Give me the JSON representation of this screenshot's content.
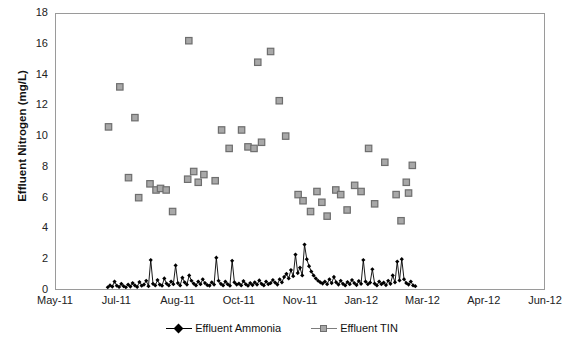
{
  "chart_data": {
    "type": "scatter",
    "title": "",
    "xlabel": "",
    "ylabel": "Effluent Nitrogen (mg/L)",
    "ylim": [
      0,
      18
    ],
    "yticks": [
      0,
      2,
      4,
      6,
      8,
      10,
      12,
      14,
      16,
      18
    ],
    "xticks": [
      "May-11",
      "Jul-11",
      "Aug-11",
      "Oct-11",
      "Nov-11",
      "Jan-12",
      "Mar-12",
      "Apr-12",
      "Jun-12"
    ],
    "xlim_months": [
      0,
      13
    ],
    "grid": true,
    "legend_position": "bottom",
    "series": [
      {
        "name": "Effluent TIN",
        "marker": "square",
        "color": "#a8a8a8",
        "edge_color": "#6e6e6e",
        "line": "none",
        "points": [
          {
            "x": 1.42,
            "y": 10.6
          },
          {
            "x": 1.72,
            "y": 13.2
          },
          {
            "x": 1.95,
            "y": 7.3
          },
          {
            "x": 2.12,
            "y": 11.2
          },
          {
            "x": 2.22,
            "y": 6.0
          },
          {
            "x": 2.52,
            "y": 6.9
          },
          {
            "x": 2.68,
            "y": 6.5
          },
          {
            "x": 2.8,
            "y": 6.6
          },
          {
            "x": 2.95,
            "y": 6.5
          },
          {
            "x": 3.12,
            "y": 5.1
          },
          {
            "x": 3.52,
            "y": 7.2
          },
          {
            "x": 3.68,
            "y": 7.7
          },
          {
            "x": 3.8,
            "y": 7.0
          },
          {
            "x": 3.95,
            "y": 7.5
          },
          {
            "x": 3.55,
            "y": 16.2
          },
          {
            "x": 4.25,
            "y": 7.1
          },
          {
            "x": 4.42,
            "y": 10.4
          },
          {
            "x": 4.62,
            "y": 9.2
          },
          {
            "x": 4.95,
            "y": 10.4
          },
          {
            "x": 5.12,
            "y": 9.3
          },
          {
            "x": 5.28,
            "y": 9.2
          },
          {
            "x": 5.48,
            "y": 9.6
          },
          {
            "x": 5.38,
            "y": 14.8
          },
          {
            "x": 5.72,
            "y": 15.5
          },
          {
            "x": 5.95,
            "y": 12.3
          },
          {
            "x": 6.12,
            "y": 10.0
          },
          {
            "x": 6.45,
            "y": 6.2
          },
          {
            "x": 6.58,
            "y": 5.8
          },
          {
            "x": 6.78,
            "y": 5.1
          },
          {
            "x": 6.95,
            "y": 6.4
          },
          {
            "x": 7.08,
            "y": 5.7
          },
          {
            "x": 7.22,
            "y": 4.8
          },
          {
            "x": 7.45,
            "y": 6.5
          },
          {
            "x": 7.58,
            "y": 6.2
          },
          {
            "x": 7.75,
            "y": 5.2
          },
          {
            "x": 7.95,
            "y": 6.8
          },
          {
            "x": 8.12,
            "y": 6.4
          },
          {
            "x": 8.32,
            "y": 9.2
          },
          {
            "x": 8.48,
            "y": 5.6
          },
          {
            "x": 8.75,
            "y": 8.3
          },
          {
            "x": 9.05,
            "y": 6.2
          },
          {
            "x": 9.18,
            "y": 4.5
          },
          {
            "x": 9.32,
            "y": 7.0
          },
          {
            "x": 9.48,
            "y": 8.1
          },
          {
            "x": 9.38,
            "y": 6.3
          }
        ]
      },
      {
        "name": "Effluent Ammonia",
        "marker": "diamond",
        "color": "#000000",
        "line": "solid",
        "description": "Dense daily series near 0 with periodic spikes up to ~3.0 mg/L",
        "points": [
          {
            "x": 1.4,
            "y": 0.18
          },
          {
            "x": 1.46,
            "y": 0.3
          },
          {
            "x": 1.52,
            "y": 0.22
          },
          {
            "x": 1.58,
            "y": 0.55
          },
          {
            "x": 1.64,
            "y": 0.28
          },
          {
            "x": 1.7,
            "y": 0.2
          },
          {
            "x": 1.76,
            "y": 0.4
          },
          {
            "x": 1.82,
            "y": 0.25
          },
          {
            "x": 1.88,
            "y": 0.18
          },
          {
            "x": 1.94,
            "y": 0.35
          },
          {
            "x": 2.0,
            "y": 0.22
          },
          {
            "x": 2.06,
            "y": 0.45
          },
          {
            "x": 2.12,
            "y": 0.3
          },
          {
            "x": 2.18,
            "y": 0.2
          },
          {
            "x": 2.24,
            "y": 0.52
          },
          {
            "x": 2.3,
            "y": 0.28
          },
          {
            "x": 2.36,
            "y": 0.35
          },
          {
            "x": 2.42,
            "y": 0.6
          },
          {
            "x": 2.48,
            "y": 0.25
          },
          {
            "x": 2.54,
            "y": 1.95
          },
          {
            "x": 2.6,
            "y": 0.4
          },
          {
            "x": 2.66,
            "y": 0.3
          },
          {
            "x": 2.72,
            "y": 0.65
          },
          {
            "x": 2.78,
            "y": 0.35
          },
          {
            "x": 2.84,
            "y": 0.28
          },
          {
            "x": 2.9,
            "y": 0.75
          },
          {
            "x": 2.96,
            "y": 0.42
          },
          {
            "x": 3.02,
            "y": 0.3
          },
          {
            "x": 3.08,
            "y": 0.55
          },
          {
            "x": 3.14,
            "y": 0.38
          },
          {
            "x": 3.2,
            "y": 1.6
          },
          {
            "x": 3.26,
            "y": 0.45
          },
          {
            "x": 3.32,
            "y": 0.3
          },
          {
            "x": 3.38,
            "y": 0.8
          },
          {
            "x": 3.44,
            "y": 0.5
          },
          {
            "x": 3.5,
            "y": 0.35
          },
          {
            "x": 3.56,
            "y": 0.95
          },
          {
            "x": 3.62,
            "y": 0.6
          },
          {
            "x": 3.68,
            "y": 0.42
          },
          {
            "x": 3.74,
            "y": 0.3
          },
          {
            "x": 3.8,
            "y": 0.55
          },
          {
            "x": 3.86,
            "y": 0.38
          },
          {
            "x": 3.92,
            "y": 0.7
          },
          {
            "x": 3.98,
            "y": 0.45
          },
          {
            "x": 4.04,
            "y": 0.32
          },
          {
            "x": 4.1,
            "y": 0.28
          },
          {
            "x": 4.16,
            "y": 0.5
          },
          {
            "x": 4.22,
            "y": 0.35
          },
          {
            "x": 4.28,
            "y": 2.1
          },
          {
            "x": 4.34,
            "y": 0.6
          },
          {
            "x": 4.4,
            "y": 0.4
          },
          {
            "x": 4.46,
            "y": 0.3
          },
          {
            "x": 4.52,
            "y": 0.55
          },
          {
            "x": 4.58,
            "y": 0.38
          },
          {
            "x": 4.64,
            "y": 0.28
          },
          {
            "x": 4.7,
            "y": 1.9
          },
          {
            "x": 4.76,
            "y": 0.5
          },
          {
            "x": 4.82,
            "y": 0.35
          },
          {
            "x": 4.88,
            "y": 0.42
          },
          {
            "x": 4.94,
            "y": 0.3
          },
          {
            "x": 5.0,
            "y": 0.58
          },
          {
            "x": 5.06,
            "y": 0.38
          },
          {
            "x": 5.12,
            "y": 0.28
          },
          {
            "x": 5.18,
            "y": 0.45
          },
          {
            "x": 5.24,
            "y": 0.32
          },
          {
            "x": 5.3,
            "y": 0.5
          },
          {
            "x": 5.36,
            "y": 0.35
          },
          {
            "x": 5.42,
            "y": 0.62
          },
          {
            "x": 5.48,
            "y": 0.4
          },
          {
            "x": 5.54,
            "y": 0.3
          },
          {
            "x": 5.6,
            "y": 0.55
          },
          {
            "x": 5.66,
            "y": 0.38
          },
          {
            "x": 5.72,
            "y": 0.45
          },
          {
            "x": 5.78,
            "y": 0.65
          },
          {
            "x": 5.84,
            "y": 0.48
          },
          {
            "x": 5.9,
            "y": 0.35
          },
          {
            "x": 5.96,
            "y": 0.7
          },
          {
            "x": 6.02,
            "y": 0.5
          },
          {
            "x": 6.08,
            "y": 0.85
          },
          {
            "x": 6.14,
            "y": 1.05
          },
          {
            "x": 6.2,
            "y": 0.75
          },
          {
            "x": 6.26,
            "y": 1.3
          },
          {
            "x": 6.32,
            "y": 0.9
          },
          {
            "x": 6.38,
            "y": 2.3
          },
          {
            "x": 6.44,
            "y": 1.1
          },
          {
            "x": 6.5,
            "y": 1.45
          },
          {
            "x": 6.56,
            "y": 0.95
          },
          {
            "x": 6.62,
            "y": 2.95
          },
          {
            "x": 6.68,
            "y": 2.0
          },
          {
            "x": 6.74,
            "y": 1.55
          },
          {
            "x": 6.8,
            "y": 1.2
          },
          {
            "x": 6.86,
            "y": 0.95
          },
          {
            "x": 6.92,
            "y": 0.75
          },
          {
            "x": 6.98,
            "y": 0.6
          },
          {
            "x": 7.04,
            "y": 0.5
          },
          {
            "x": 7.1,
            "y": 0.42
          },
          {
            "x": 7.16,
            "y": 0.55
          },
          {
            "x": 7.22,
            "y": 0.38
          },
          {
            "x": 7.28,
            "y": 0.7
          },
          {
            "x": 7.34,
            "y": 0.45
          },
          {
            "x": 7.4,
            "y": 0.85
          },
          {
            "x": 7.46,
            "y": 0.5
          },
          {
            "x": 7.52,
            "y": 0.35
          },
          {
            "x": 7.58,
            "y": 0.6
          },
          {
            "x": 7.64,
            "y": 0.4
          },
          {
            "x": 7.7,
            "y": 0.3
          },
          {
            "x": 7.76,
            "y": 0.52
          },
          {
            "x": 7.82,
            "y": 0.38
          },
          {
            "x": 7.88,
            "y": 0.65
          },
          {
            "x": 7.94,
            "y": 0.45
          },
          {
            "x": 8.0,
            "y": 0.32
          },
          {
            "x": 8.06,
            "y": 0.58
          },
          {
            "x": 8.12,
            "y": 0.4
          },
          {
            "x": 8.18,
            "y": 1.95
          },
          {
            "x": 8.24,
            "y": 0.55
          },
          {
            "x": 8.3,
            "y": 0.38
          },
          {
            "x": 8.36,
            "y": 0.48
          },
          {
            "x": 8.42,
            "y": 1.35
          },
          {
            "x": 8.48,
            "y": 0.42
          },
          {
            "x": 8.54,
            "y": 0.3
          },
          {
            "x": 8.6,
            "y": 0.55
          },
          {
            "x": 8.66,
            "y": 0.38
          },
          {
            "x": 8.72,
            "y": 0.48
          },
          {
            "x": 8.78,
            "y": 0.32
          },
          {
            "x": 8.84,
            "y": 0.6
          },
          {
            "x": 8.9,
            "y": 0.4
          },
          {
            "x": 8.96,
            "y": 0.95
          },
          {
            "x": 9.02,
            "y": 0.5
          },
          {
            "x": 9.08,
            "y": 1.85
          },
          {
            "x": 9.14,
            "y": 0.62
          },
          {
            "x": 9.2,
            "y": 2.0
          },
          {
            "x": 9.26,
            "y": 0.7
          },
          {
            "x": 9.32,
            "y": 0.45
          },
          {
            "x": 9.38,
            "y": 0.35
          },
          {
            "x": 9.44,
            "y": 0.55
          },
          {
            "x": 9.5,
            "y": 0.3
          },
          {
            "x": 9.56,
            "y": 0.25
          }
        ]
      }
    ]
  },
  "legend": {
    "items": [
      {
        "label": "Effluent Ammonia",
        "marker": "diamond"
      },
      {
        "label": "Effluent TIN",
        "marker": "square"
      }
    ]
  }
}
